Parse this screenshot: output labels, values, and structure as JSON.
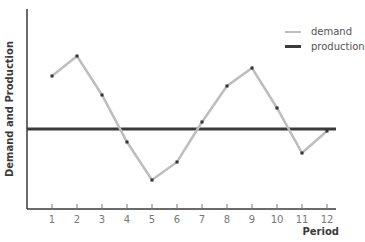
{
  "chart_data": {
    "type": "line",
    "title": "",
    "xlabel": "Period",
    "ylabel": "Demand and Production",
    "categories": [
      "1",
      "2",
      "3",
      "4",
      "5",
      "6",
      "7",
      "8",
      "9",
      "10",
      "11",
      "12"
    ],
    "x": [
      1,
      2,
      3,
      4,
      5,
      6,
      7,
      8,
      9,
      10,
      11,
      12
    ],
    "series": [
      {
        "name": "demand",
        "values": [
          66.5,
          76.5,
          57,
          33.5,
          14.5,
          23.5,
          43.5,
          61.5,
          70.5,
          50.5,
          28,
          39
        ],
        "color": "#bdbdbd",
        "markers": true
      },
      {
        "name": "production",
        "values": [
          40,
          40,
          40,
          40,
          40,
          40,
          40,
          40,
          40,
          40,
          40,
          40
        ],
        "color": "#3a3a3a",
        "markers": false
      }
    ],
    "ylim": [
      0,
      100
    ],
    "y_ticks_shown": false,
    "grid": false,
    "legend_position": "top-right"
  },
  "legend": {
    "items": [
      {
        "label": "demand",
        "color": "#bdbdbd"
      },
      {
        "label": "production",
        "color": "#3a3a3a"
      }
    ]
  },
  "axes": {
    "xlabel": "Period",
    "ylabel": "Demand and Production",
    "axis_color": "#3a3a3a",
    "tick_label_color": "#777777"
  }
}
